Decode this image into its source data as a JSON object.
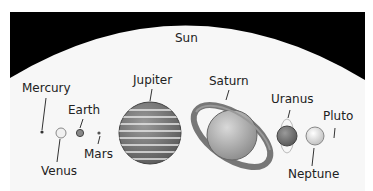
{
  "diagram": {
    "title": "Sun",
    "planets": [
      {
        "name": "Mercury"
      },
      {
        "name": "Venus"
      },
      {
        "name": "Earth"
      },
      {
        "name": "Mars"
      },
      {
        "name": "Jupiter"
      },
      {
        "name": "Saturn"
      },
      {
        "name": "Uranus"
      },
      {
        "name": "Neptune"
      },
      {
        "name": "Pluto"
      }
    ]
  }
}
